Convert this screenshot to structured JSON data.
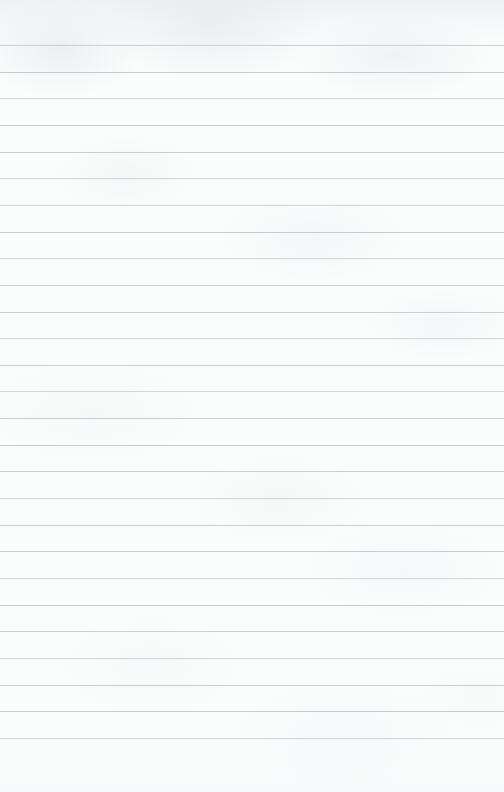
{
  "document": {
    "type": "ruled-notepad-page",
    "title": "Blank Ruled Notepad Page",
    "content_text": "",
    "has_text_content": false,
    "has_margin_rule": false,
    "has_header": false,
    "has_footer": false,
    "page_width_px": 504,
    "page_height_px": 792
  },
  "paper": {
    "background_color": "#fbfcfc",
    "texture": "subtle mottled paper grain",
    "top_shading_color": "#e4e7e9",
    "bottom_shading_color": "#f6f7f8",
    "edge_border": "none"
  },
  "ruling": {
    "line_color": "#c8ccd0",
    "line_thickness_px": 1,
    "line_spacing_px": 26.65,
    "first_line_y_px": 45,
    "last_line_y_px": 738,
    "line_count": 27,
    "spans_full_width": true,
    "orientation": "horizontal",
    "line_positions_y_px": [
      45,
      71.7,
      98.3,
      125,
      151.6,
      178.3,
      204.9,
      231.6,
      258.2,
      284.8,
      311.5,
      338.1,
      364.8,
      391.4,
      418.1,
      444.7,
      471.4,
      498,
      524.6,
      551.3,
      577.9,
      604.6,
      631.2,
      657.9,
      684.5,
      711.2,
      738
    ]
  },
  "writing_area": {
    "label": "writing-area",
    "top_px": 45,
    "bottom_px": 738,
    "left_px": 0,
    "right_px": 504,
    "placeholder": ""
  }
}
